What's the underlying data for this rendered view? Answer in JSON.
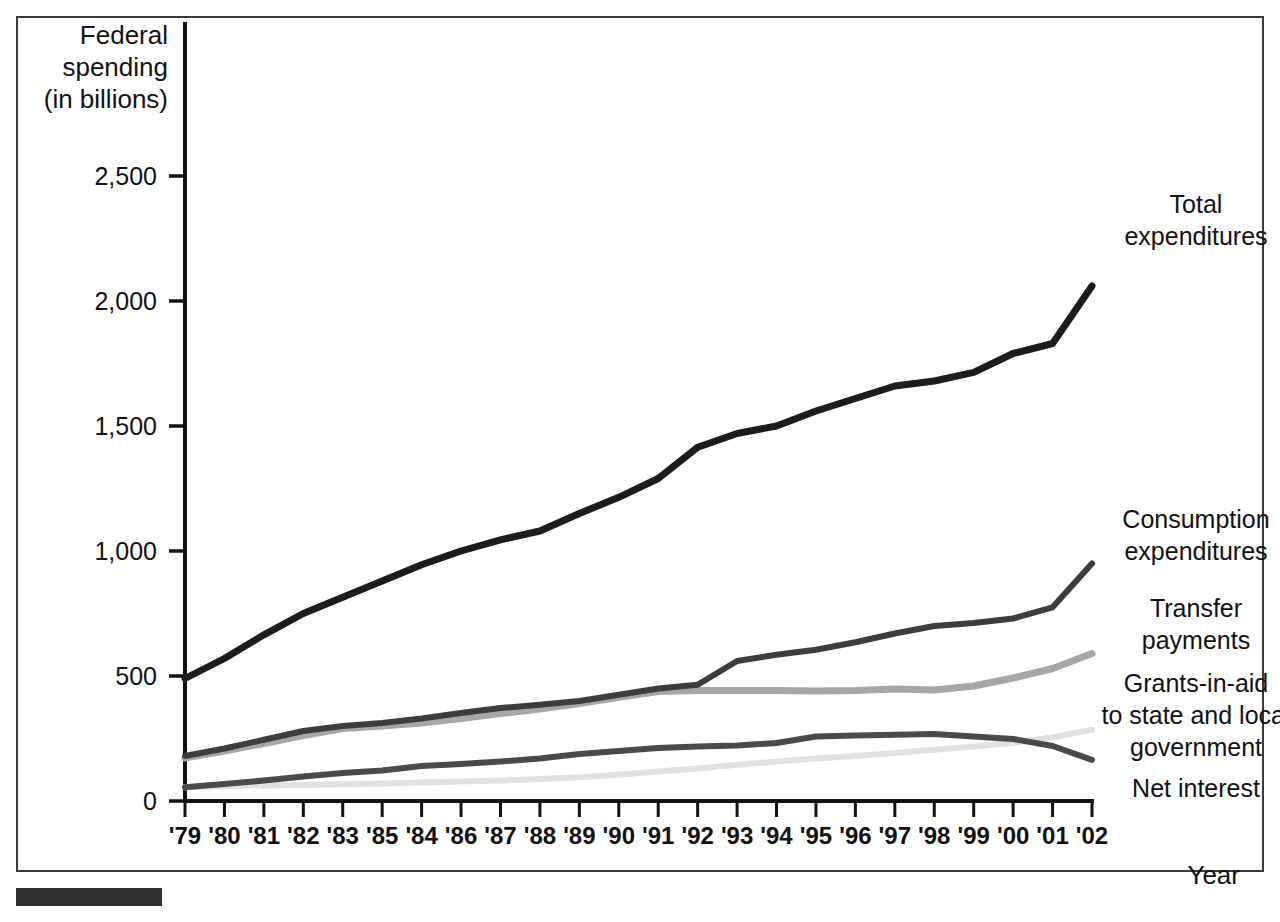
{
  "figure": {
    "background_color": "#ffffff",
    "border_color": "#3a3a3a",
    "footer_bar_color": "#2f2f2f"
  },
  "axis": {
    "y_title_line1": "Federal",
    "y_title_line2": "spending",
    "y_title_line3": "(in billions)",
    "x_title": "Year"
  },
  "chart_data": {
    "type": "line",
    "title": "",
    "xlabel": "Year",
    "ylabel": "Federal spending (in billions)",
    "ylim": [
      0,
      2500
    ],
    "yticks": [
      0,
      500,
      1000,
      1500,
      2000,
      2500
    ],
    "ytick_labels": [
      "0",
      "500",
      "1,000",
      "1,500",
      "2,000",
      "2,500"
    ],
    "grid": false,
    "legend_position": "right-inline-annotations",
    "categories": [
      "'79",
      "'80",
      "'81",
      "'82",
      "'83",
      "'85",
      "'84",
      "'86",
      "'87",
      "'88",
      "'89",
      "'90",
      "'91",
      "'92",
      "'93",
      "'94",
      "'95",
      "'96",
      "'97",
      "'98",
      "'99",
      "'00",
      "'01",
      "'02"
    ],
    "series": [
      {
        "name": "Total expenditures",
        "color": "#1c1c1c",
        "width": 7,
        "label_line1": "Total",
        "label_line2": "expenditures",
        "values": [
          490,
          570,
          665,
          750,
          815,
          880,
          945,
          1000,
          1045,
          1080,
          1150,
          1215,
          1290,
          1415,
          1470,
          1500,
          1560,
          1610,
          1660,
          1680,
          1715,
          1790,
          1830,
          2060
        ]
      },
      {
        "name": "Consumption expenditures",
        "color": "#3d3d3d",
        "width": 6,
        "label_line1": "Consumption",
        "label_line2": "expenditures",
        "values": [
          180,
          210,
          245,
          280,
          300,
          312,
          330,
          352,
          372,
          385,
          400,
          425,
          450,
          465,
          560,
          585,
          605,
          635,
          670,
          700,
          712,
          730,
          775,
          950
        ]
      },
      {
        "name": "Transfer payments",
        "color": "#a6a6a6",
        "width": 7,
        "label_line1": "Transfer",
        "label_line2": "payments",
        "values": [
          172,
          200,
          230,
          262,
          290,
          300,
          312,
          330,
          350,
          368,
          390,
          415,
          438,
          442,
          442,
          442,
          440,
          442,
          448,
          444,
          460,
          492,
          530,
          590
        ]
      },
      {
        "name": "Grants-in-aid to state and local government",
        "color": "#e0e0e0",
        "width": 6,
        "label_line1": "Grants-in-aid",
        "label_line2": "to state and local",
        "label_line3": "government",
        "values": [
          55,
          60,
          62,
          64,
          67,
          70,
          74,
          78,
          82,
          88,
          95,
          105,
          118,
          130,
          145,
          158,
          170,
          180,
          192,
          205,
          218,
          232,
          255,
          285
        ]
      },
      {
        "name": "Net interest",
        "color": "#4a4a4a",
        "width": 6,
        "label_line1": "Net interest",
        "values": [
          55,
          68,
          82,
          98,
          112,
          122,
          140,
          148,
          158,
          170,
          188,
          200,
          212,
          218,
          222,
          232,
          258,
          262,
          265,
          268,
          258,
          248,
          220,
          165
        ]
      }
    ]
  }
}
